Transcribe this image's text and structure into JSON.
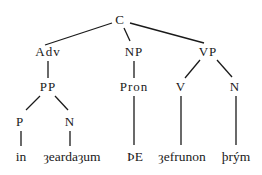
{
  "tree": {
    "nodes": [
      {
        "id": "C",
        "label": "C",
        "x": 120,
        "y": 20
      },
      {
        "id": "Adv",
        "label": "Adv",
        "x": 48,
        "y": 52
      },
      {
        "id": "NP",
        "label": "NP",
        "x": 134,
        "y": 52
      },
      {
        "id": "VP",
        "label": "VP",
        "x": 208,
        "y": 52
      },
      {
        "id": "PP",
        "label": "PP",
        "x": 48,
        "y": 87
      },
      {
        "id": "Pron",
        "label": "Pron",
        "x": 134,
        "y": 87
      },
      {
        "id": "V",
        "label": "V",
        "x": 181,
        "y": 87
      },
      {
        "id": "N1",
        "label": "N",
        "x": 235,
        "y": 87
      },
      {
        "id": "P",
        "label": "P",
        "x": 20,
        "y": 122
      },
      {
        "id": "N2",
        "label": "N",
        "x": 70,
        "y": 122
      }
    ],
    "leaves": [
      {
        "id": "w1",
        "label": "in",
        "x": 20,
        "y": 157
      },
      {
        "id": "w2",
        "label": "ȝeardaȝum",
        "x": 70,
        "y": 157
      },
      {
        "id": "w3",
        "label": "ÞE",
        "x": 134,
        "y": 157
      },
      {
        "id": "w4",
        "label": "ȝefrunon",
        "x": 181,
        "y": 157
      },
      {
        "id": "w5",
        "label": "þrým",
        "x": 235,
        "y": 157
      }
    ],
    "edges": [
      [
        "C",
        "Adv"
      ],
      [
        "C",
        "NP"
      ],
      [
        "C",
        "VP"
      ],
      [
        "Adv",
        "PP"
      ],
      [
        "NP",
        "Pron"
      ],
      [
        "VP",
        "V"
      ],
      [
        "VP",
        "N1"
      ],
      [
        "PP",
        "P"
      ],
      [
        "PP",
        "N2"
      ],
      [
        "P",
        "w1"
      ],
      [
        "N2",
        "w2"
      ],
      [
        "Pron",
        "w3"
      ],
      [
        "V",
        "w4"
      ],
      [
        "N1",
        "w5"
      ]
    ]
  }
}
